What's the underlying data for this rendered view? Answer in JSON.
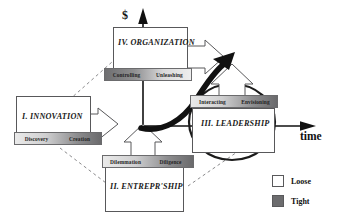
{
  "diagram": {
    "axes": {
      "vertical_label": "$",
      "horizontal_label": "time"
    },
    "quadrants": [
      {
        "id": "organization",
        "title": "IV. ORGANIZATION",
        "sublabels": [
          "Controlling",
          "Unleashing"
        ],
        "gradient": "dark-to-light"
      },
      {
        "id": "innovation",
        "title": "I. INNOVATION",
        "sublabels": [
          "Discovery",
          "Creation"
        ],
        "gradient": "light-to-dark"
      },
      {
        "id": "entrepreneurship",
        "title": "II. ENTREPR'SHIP",
        "sublabels": [
          "Dilemmation",
          "Diligence"
        ],
        "gradient": "light-to-dark"
      },
      {
        "id": "leadership",
        "title": "III. LEADERSHIP",
        "sublabels": [
          "Interacting",
          "Envisioning"
        ],
        "gradient": "light-to-dark"
      }
    ],
    "legend": {
      "items": [
        {
          "label": "Loose",
          "color": "#ffffff"
        },
        {
          "label": "Tight",
          "color": "#6c6c6e"
        }
      ]
    }
  }
}
